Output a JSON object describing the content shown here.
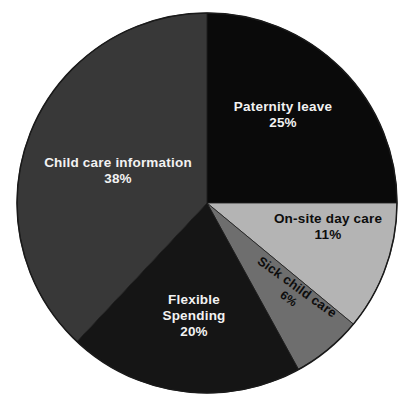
{
  "chart_data": {
    "type": "pie",
    "title": "",
    "subtitle": "",
    "xlabel": "",
    "ylabel": "",
    "legend_position": "none",
    "grid": false,
    "labels_inside_slices": true,
    "value_unit": "%",
    "categories": [
      "Paternity leave",
      "On-site day care",
      "Sick child care",
      "Flexible Spending",
      "Child care information"
    ],
    "values": [
      25,
      11,
      6,
      20,
      38
    ],
    "slices": [
      {
        "label": "Paternity leave",
        "value": 25,
        "value_text": "25%",
        "color": "#0a0a0a",
        "text_color": "#f2f2f2",
        "start_angle": 0,
        "end_angle": 90
      },
      {
        "label": "On-site day care",
        "value": 11,
        "value_text": "11%",
        "color": "#b4b4b4",
        "text_color": "#0d0d0d",
        "start_angle": 90,
        "end_angle": 129.6
      },
      {
        "label": "Sick child care",
        "value": 6,
        "value_text": "6%",
        "color": "#6e6e6e",
        "text_color": "#0d0d0d",
        "start_angle": 129.6,
        "end_angle": 151.2
      },
      {
        "label": "Flexible Spending",
        "value": 20,
        "value_text": "20%",
        "color": "#151515",
        "text_color": "#f2f2f2",
        "start_angle": 151.2,
        "end_angle": 223.2
      },
      {
        "label": "Child care information",
        "value": 38,
        "value_text": "38%",
        "color": "#383838",
        "text_color": "#f2f2f2",
        "start_angle": 223.2,
        "end_angle": 360
      }
    ],
    "geometry": {
      "center_x": 207,
      "center_y": 203,
      "radius": 190
    },
    "style": {
      "background": "#ffffff",
      "outline_color": "#1a1a1a",
      "outline_width": 1.5
    }
  },
  "labels": {
    "paternity_leave": {
      "name": "Paternity leave",
      "value": "25%"
    },
    "child_care_information": {
      "name": "Child care information",
      "value": "38%"
    },
    "on_site_day_care": {
      "name": "On-site day care",
      "value": "11%"
    },
    "sick_child_care": {
      "name": "Sick child care",
      "value": "6%"
    },
    "flexible_spending": {
      "name_line1": "Flexible",
      "name_line2": "Spending",
      "value": "20%"
    }
  }
}
